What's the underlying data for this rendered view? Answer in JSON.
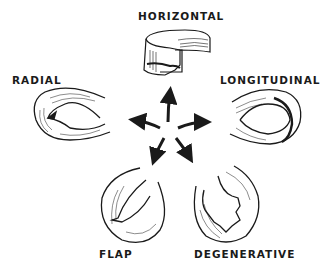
{
  "diagram": {
    "type": "meniscus-tear-patterns",
    "center": "five-arrow-star",
    "labels": {
      "horizontal": "HORIZONTAL",
      "radial": "RADIAL",
      "longitudinal": "LONGITUDINAL",
      "flap": "FLAP",
      "degenerative": "DEGENERATIVE"
    },
    "colors": {
      "ink": "#1a1a1a",
      "background": "#ffffff"
    }
  }
}
